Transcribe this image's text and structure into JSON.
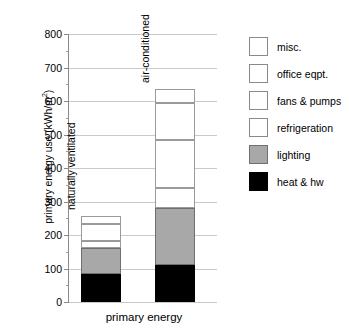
{
  "chart_data": {
    "type": "bar",
    "stacked": true,
    "title": "",
    "xlabel": "primary energy",
    "ylabel": "primary energy use (kWh/m 2)",
    "ylabel_base": "primary energy use (kWh/m",
    "ylabel_sup": "2",
    "ylabel_close": ")",
    "ylim": [
      0,
      800
    ],
    "ytick_step": 100,
    "yminor_step": 50,
    "grid": true,
    "legend_position": "right",
    "categories": [
      "naturally ventilated",
      "air-conditioned"
    ],
    "yticks": [
      "0",
      "100",
      "200",
      "300",
      "400",
      "500",
      "600",
      "700",
      "800"
    ],
    "series": [
      {
        "name": "heat & hw",
        "style": "black",
        "values": [
          84,
          110
        ]
      },
      {
        "name": "lighting",
        "style": "gray",
        "values": [
          76,
          170
        ]
      },
      {
        "name": "refrigeration",
        "style": "outline",
        "values": [
          22,
          60
        ]
      },
      {
        "name": "fans & pumps",
        "style": "outline",
        "values": [
          51,
          145
        ]
      },
      {
        "name": "office eqpt.",
        "style": "outline",
        "values": [
          24,
          110
        ]
      },
      {
        "name": "misc.",
        "style": "outline",
        "values": [
          0,
          40
        ]
      }
    ],
    "totals": [
      257,
      635
    ],
    "legend": [
      {
        "label": "misc.",
        "style": "outline"
      },
      {
        "label": "office eqpt.",
        "style": "outline"
      },
      {
        "label": "fans & pumps",
        "style": "outline"
      },
      {
        "label": "refrigeration",
        "style": "outline"
      },
      {
        "label": "lighting",
        "style": "gray"
      },
      {
        "label": "heat & hw",
        "style": "black"
      }
    ],
    "colors": {
      "black": "#000000",
      "gray": "#a8a8a8",
      "outline": "#ffffff",
      "grid": "#c9c9c9",
      "axis": "#8a8a8a"
    }
  }
}
